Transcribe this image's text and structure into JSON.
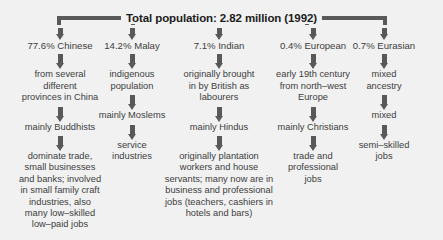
{
  "title": "Total population: 2.82 million (1992)",
  "columns": [
    {
      "id": "chinese",
      "header": "77.6% Chinese",
      "nodes": [
        "from several\ndifferent\nprovinces in China",
        "mainly Buddhists",
        "dominate trade,\nsmall businesses\nand banks; involved\nin small family craft\nindustries, also\nmany low–skilled\nlow–paid jobs"
      ]
    },
    {
      "id": "malay",
      "header": "14.2% Malay",
      "nodes": [
        "indigenous\npopulation",
        "mainly Moslems",
        "service\nindustries"
      ]
    },
    {
      "id": "indian",
      "header": "7.1% Indian",
      "nodes": [
        "originally brought\nin by British as\nlabourers",
        "mainly Hindus",
        "originally plantation\nworkers and house\nservants; many now are in\nbusiness and professional\njobs (teachers, cashiers in\nhotels and bars)"
      ]
    },
    {
      "id": "european",
      "header": "0.4% European",
      "nodes": [
        "early 19th century\nfrom north–west\nEurope",
        "mainly Christians",
        "trade and\nprofessional\njobs"
      ]
    },
    {
      "id": "eurasian",
      "header": "0.7% Eurasian",
      "nodes": [
        "mixed\nancestry",
        "mixed",
        "semi–skilled\njobs"
      ]
    }
  ],
  "colors": {
    "background": "#f1f1f1",
    "arrow": "#595959",
    "text": "#3d3d3d",
    "title_text": "#1c1c1c"
  }
}
